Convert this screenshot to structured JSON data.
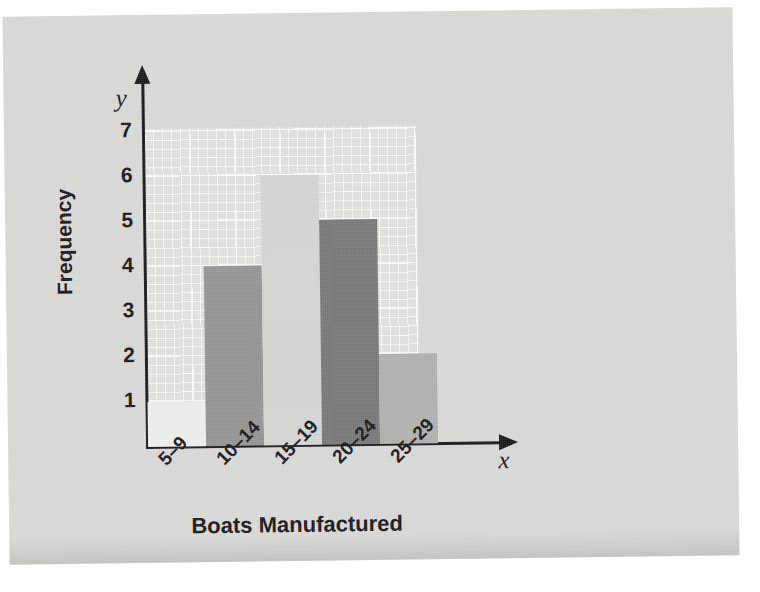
{
  "chart_data": {
    "type": "bar",
    "title": "",
    "subtitle": "",
    "xlabel": "Boats Manufactured",
    "ylabel": "Frequency",
    "x_axis_symbol": "x",
    "y_axis_symbol": "y",
    "categories": [
      "5–9",
      "10–14",
      "15–19",
      "20–24",
      "25–29"
    ],
    "values": [
      1,
      4,
      6,
      5,
      2
    ],
    "ylim": [
      0,
      7
    ],
    "y_ticks": [
      "7",
      "6",
      "5",
      "4",
      "3",
      "2",
      "1"
    ],
    "y_tick_values": [
      7,
      6,
      5,
      4,
      3,
      2,
      1
    ],
    "grid": true,
    "legend": "none",
    "bar_colors": [
      "#eeeeec",
      "#949494",
      "#d5d5d3",
      "#777777",
      "#b0b0ae"
    ],
    "bars": [
      {
        "category": "5–9",
        "value": 1,
        "color": "#eeeeec"
      },
      {
        "category": "10–14",
        "value": 4,
        "color": "#949494"
      },
      {
        "category": "15–19",
        "value": 6,
        "color": "#d5d5d3"
      },
      {
        "category": "20–24",
        "value": 5,
        "color": "#777777"
      },
      {
        "category": "25–29",
        "value": 2,
        "color": "#b0b0ae"
      }
    ]
  },
  "colors": {
    "paper": "#d9d9d7",
    "grid_paper": "#e2e2e0",
    "axis": "#17171a",
    "text": "#17171a"
  }
}
